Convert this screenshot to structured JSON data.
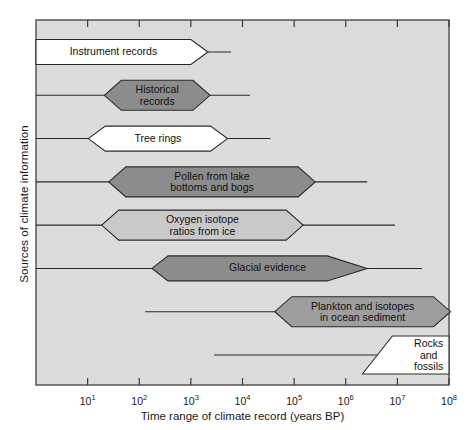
{
  "chart_data": {
    "type": "bar",
    "title": "",
    "xlabel": "Time range of climate record (years BP)",
    "ylabel": "Sources of climate information",
    "xscale": "log",
    "xlim": [
      1,
      100000000
    ],
    "xticks": [
      {
        "label": "10",
        "exp": "1",
        "value": 10
      },
      {
        "label": "10",
        "exp": "2",
        "value": 100
      },
      {
        "label": "10",
        "exp": "3",
        "value": 1000
      },
      {
        "label": "10",
        "exp": "4",
        "value": 10000
      },
      {
        "label": "10",
        "exp": "5",
        "value": 100000
      },
      {
        "label": "10",
        "exp": "6",
        "value": 1000000
      },
      {
        "label": "10",
        "exp": "7",
        "value": 10000000
      },
      {
        "label": "10",
        "exp": "8",
        "value": 100000000
      }
    ],
    "grid": false,
    "legend": false,
    "plot_background": "#dcdcdc",
    "frame_color": "#4a4a4a",
    "categories": [
      "Instrument records",
      "Historical records",
      "Tree rings",
      "Pollen from lake bottoms and bogs",
      "Oxygen isotope ratios from ice",
      "Glacial evidence",
      "Plankton and isotopes in ocean sediment",
      "Rocks and fossils"
    ],
    "series": [
      {
        "name": "Instrument records",
        "label": "Instrument records",
        "fill": "#ffffff",
        "core_start": 1,
        "core_end": 1000,
        "line_start": 1,
        "line_end": 6000
      },
      {
        "name": "Historical records",
        "label": "Historical\nrecords",
        "fill": "#8c8c8c",
        "core_start": 45,
        "core_end": 1100,
        "line_start": 1,
        "line_end": 14000
      },
      {
        "name": "Tree rings",
        "label": "Tree rings",
        "fill": "#ffffff",
        "core_start": 22,
        "core_end": 2400,
        "line_start": 1,
        "line_end": 35000
      },
      {
        "name": "Pollen from lake bottoms and bogs",
        "label": "Pollen from lake\nbottoms and bogs",
        "fill": "#8c8c8c",
        "core_start": 55,
        "core_end": 120000,
        "line_start": 1,
        "line_end": 2600000
      },
      {
        "name": "Oxygen isotope ratios from ice",
        "label": "Oxygen isotope\nratios from ice",
        "fill": "#c9c9c9",
        "core_start": 40,
        "core_end": 70000,
        "line_start": 1,
        "line_end": 9000000
      },
      {
        "name": "Glacial evidence",
        "label": "Glacial evidence",
        "fill": "#8c8c8c",
        "core_start": 360,
        "core_end": 2600000,
        "line_start": 1,
        "line_end": 30000000
      },
      {
        "name": "Plankton and isotopes in ocean sediment",
        "label": "Plankton and isotopes\nin ocean sediment",
        "fill": "#9e9e9e",
        "core_start": 90000,
        "core_end": 50000000,
        "line_start": 130,
        "line_end": 100000000
      },
      {
        "name": "Rocks and fossils",
        "label": "Rocks\nand\nfossils",
        "fill": "#ffffff",
        "core_start": 8000000,
        "core_end": 100000000,
        "line_start": 2800,
        "line_end": 100000000
      }
    ]
  }
}
